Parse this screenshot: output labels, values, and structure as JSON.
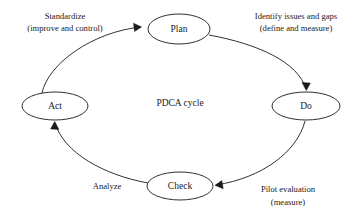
{
  "diagram": {
    "title": "PDCA cycle",
    "center_label": "PDCA cycle",
    "nodes": [
      {
        "id": "plan",
        "label": "Plan",
        "cx": 179,
        "cy": 29,
        "rx": 31,
        "ry": 15
      },
      {
        "id": "do",
        "label": "Do",
        "cx": 306,
        "cy": 106,
        "rx": 34,
        "ry": 14
      },
      {
        "id": "check",
        "label": "Check",
        "cx": 180,
        "cy": 186,
        "rx": 33,
        "ry": 14
      },
      {
        "id": "act",
        "label": "Act",
        "cx": 55,
        "cy": 106,
        "rx": 33,
        "ry": 14
      }
    ],
    "edges": [
      {
        "id": "plan-to-do",
        "from": "plan",
        "to": "do",
        "label_lines": [
          "Identify issues and gaps",
          "(define and measure)"
        ],
        "label_x": 315,
        "label_y": 18,
        "label_align": "middle"
      },
      {
        "id": "do-to-check",
        "from": "do",
        "to": "check",
        "label_lines": [
          "Pilot evaluation",
          "(measure)"
        ],
        "label_x": 285,
        "label_y": 190,
        "label_align": "middle"
      },
      {
        "id": "check-to-act",
        "from": "check",
        "to": "act",
        "label_lines": [
          "Analyze"
        ],
        "label_x": 108,
        "label_y": 187,
        "label_align": "middle"
      },
      {
        "id": "act-to-plan",
        "from": "act",
        "to": "plan",
        "label_lines": [
          "Standardize",
          "(improve and control)"
        ],
        "label_x": 65,
        "label_y": 18,
        "label_align": "middle"
      }
    ],
    "colors": {
      "background": "#ffffff",
      "stroke": "#1a1a1a",
      "text": "#1a1a1a",
      "node_fill": "#ffffff"
    }
  }
}
